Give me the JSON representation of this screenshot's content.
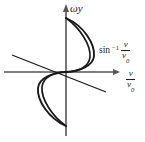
{
  "figure": {
    "name": "arcsine-wave-diagram",
    "background_color": "#ffffff",
    "ink_color": "#1a1a1a",
    "axis_color": "#4d4d4d",
    "width": 145,
    "height": 142
  },
  "axes": {
    "vertical": {
      "label": "ωy",
      "arrow": "up",
      "x": 66,
      "y_top": 5,
      "y_bottom": 136
    },
    "horizontal": {
      "label_numerator": "v",
      "label_denominator": "v",
      "label_denominator_sub": "0",
      "arrow": "right",
      "y": 72,
      "x_left": 4,
      "x_right": 120
    },
    "origin": {
      "x": 66,
      "y": 72
    }
  },
  "annotations": [
    {
      "name": "arcsin-annotation",
      "function": "sin",
      "exponent": "−1",
      "numerator": "v",
      "denominator": "v",
      "denominator_sub": "0",
      "x": 99,
      "y": 40
    }
  ],
  "chart_data": {
    "type": "line",
    "title": "",
    "xlabel": "v/v₀",
    "ylabel": "ωy",
    "grid": false,
    "legend": false,
    "series": [
      {
        "name": "arcsine-branch-outer",
        "path": "M 66,18 C 84,26 95,44 94,56 C 93,66 80,71 66,72 C 52,73 39,78 38,88 C 37,100 48,118 66,126"
      },
      {
        "name": "arcsine-branch-inner",
        "path": "M 66,18 C 80,28 91,45 90,57 C 89,67 78,72 66,72 C 54,72 43,77 42,87 C 41,99 52,116 66,126"
      },
      {
        "name": "tangent-line",
        "x1": 12,
        "y1": 55,
        "x2": 106,
        "y2": 92
      }
    ],
    "xlim": [
      -66,
      79
    ],
    "ylim": [
      -64,
      67
    ]
  }
}
